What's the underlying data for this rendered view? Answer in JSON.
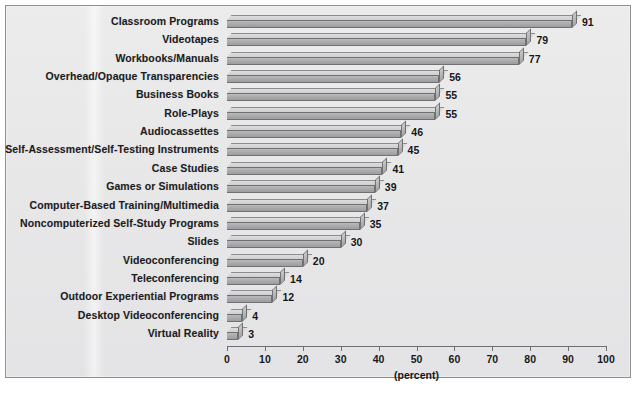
{
  "figure": {
    "axis_title": "(percent)",
    "background_color": "#e8e8e9",
    "frame_color": "#8d8f90",
    "bar_front_color": "#aaaaac",
    "bar_top_color": "#d6d6d7",
    "bar_outline_color": "#6f7072",
    "text_color": "#17171a"
  },
  "chart_data": {
    "type": "bar",
    "orientation": "horizontal",
    "title": "",
    "subtitle": "",
    "xlabel": "(percent)",
    "ylabel": "",
    "xlim": [
      0,
      100
    ],
    "xticks": [
      0,
      10,
      20,
      30,
      40,
      50,
      60,
      70,
      80,
      90,
      100
    ],
    "xtick_labels": [
      "0",
      "10",
      "20",
      "30",
      "40",
      "50",
      "60",
      "70",
      "80",
      "90",
      "100"
    ],
    "grid": false,
    "legend": null,
    "data_labels": true,
    "categories": [
      "Classroom Programs",
      "Videotapes",
      "Workbooks/Manuals",
      "Overhead/Opaque Transparencies",
      "Business Books",
      "Role-Plays",
      "Audiocassettes",
      "Self-Assessment/Self-Testing Instruments",
      "Case Studies",
      "Games or Simulations",
      "Computer-Based Training/Multimedia",
      "Noncomputerized Self-Study Programs",
      "Slides",
      "Videoconferencing",
      "Teleconferencing",
      "Outdoor Experiential Programs",
      "Desktop Videoconferencing",
      "Virtual Reality"
    ],
    "values": [
      91,
      79,
      77,
      56,
      55,
      55,
      46,
      45,
      41,
      39,
      37,
      35,
      30,
      20,
      14,
      12,
      4,
      3
    ],
    "value_labels": [
      "91",
      "79",
      "77",
      "56",
      "55",
      "55",
      "46",
      "45",
      "41",
      "39",
      "37",
      "35",
      "30",
      "20",
      "14",
      "12",
      "4",
      "3"
    ]
  }
}
